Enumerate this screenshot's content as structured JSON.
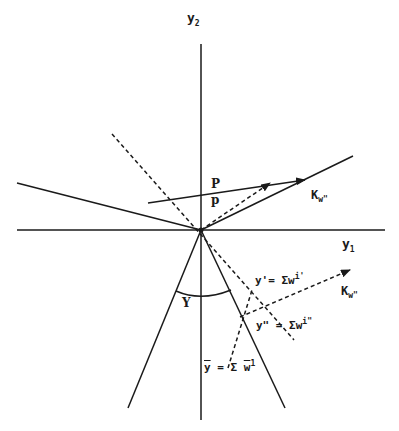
{
  "diagram": {
    "type": "vector geometry diagram",
    "colors": {
      "ink": "#1a1a1a",
      "background": "#ffffff"
    },
    "axes": {
      "y1": {
        "label": "y",
        "subscript": "1"
      },
      "y2": {
        "label": "y",
        "subscript": "2"
      }
    },
    "labels": {
      "P": "P",
      "p": "p",
      "K_w_double_prime_upper": {
        "base": "K",
        "subscript": "w\""
      },
      "K_w_double_prime_lower": {
        "base": "K",
        "subscript": "w\""
      },
      "gamma": "Y",
      "y_prime": "y'= Σw",
      "y_prime_sup": "i'",
      "y_double_prime": "y\" = Σw",
      "y_double_prime_sup": "i\"",
      "y_bar_lhs": "y",
      "y_bar_eq": " = Σ ",
      "y_bar_w": "w",
      "y_bar_sup": "1"
    }
  }
}
